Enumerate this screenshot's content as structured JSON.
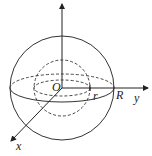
{
  "labels": {
    "origin": "O",
    "inner_radius": "r",
    "outer_radius": "R",
    "y_axis": "y",
    "x_axis": "x"
  },
  "colors": {
    "stroke": "#333333",
    "background": "#ffffff"
  }
}
